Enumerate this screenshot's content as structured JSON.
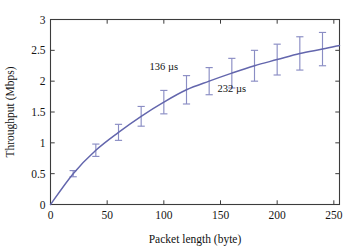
{
  "chart_data": {
    "type": "line",
    "title": "",
    "xlabel": "Packet length (byte)",
    "ylabel": "Throughput (Mbps)",
    "xlim": [
      0,
      255
    ],
    "ylim": [
      0,
      3
    ],
    "xticks": [
      0,
      50,
      100,
      150,
      200,
      250
    ],
    "xticklabels": [
      "0",
      "50",
      "100",
      "150",
      "200",
      "250"
    ],
    "yticks": [
      0,
      0.5,
      1,
      1.5,
      2,
      2.5,
      3
    ],
    "yticklabels": [
      "0",
      "0.5",
      "1",
      "1.5",
      "2",
      "2.5",
      "3"
    ],
    "grid": false,
    "legend": null,
    "series": [
      {
        "name": "Throughput",
        "color": "#6366ad",
        "x": [
          0,
          20,
          40,
          60,
          80,
          100,
          120,
          140,
          160,
          180,
          200,
          220,
          240,
          255
        ],
        "y": [
          0,
          0.5,
          0.88,
          1.17,
          1.43,
          1.66,
          1.86,
          2.0,
          2.13,
          2.25,
          2.35,
          2.45,
          2.52,
          2.58
        ],
        "errorbars": {
          "x": [
            20,
            40,
            60,
            80,
            100,
            120,
            140,
            160,
            180,
            200,
            220,
            240
          ],
          "y": [
            0.5,
            0.88,
            1.17,
            1.43,
            1.66,
            1.86,
            2.0,
            2.13,
            2.25,
            2.35,
            2.45,
            2.52
          ],
          "err": [
            0.05,
            0.1,
            0.13,
            0.16,
            0.19,
            0.23,
            0.22,
            0.24,
            0.25,
            0.25,
            0.27,
            0.27
          ]
        }
      }
    ],
    "annotations": [
      {
        "text": "136 µs",
        "x": 100,
        "y": 2.18
      },
      {
        "text": "232 µs",
        "x": 160,
        "y": 1.83
      }
    ],
    "style": {
      "curve_color": "#6366ad",
      "errorbar_color": "#8a8dc4",
      "axis_color": "#3c3c3c",
      "background": "#ffffff"
    }
  }
}
